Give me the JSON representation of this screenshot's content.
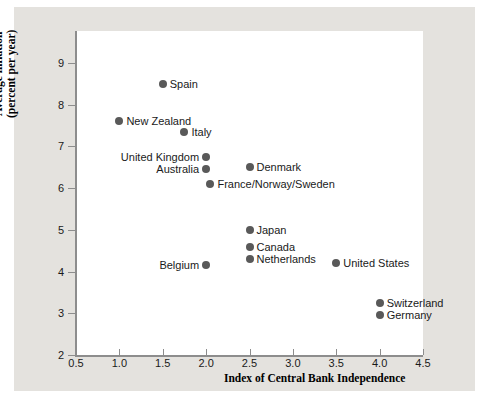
{
  "chart_data": {
    "type": "scatter",
    "title": "",
    "xlabel": "Index of Central Bank Independence",
    "ylabel_line1": "Average inflation",
    "ylabel_line2": "(percent per year)",
    "xlim": [
      0.5,
      4.5
    ],
    "ylim": [
      2,
      9
    ],
    "xticks": [
      "0.5",
      "1.0",
      "1.5",
      "2.0",
      "2.5",
      "3.0",
      "3.5",
      "4.0",
      "4.5"
    ],
    "xtick_values": [
      0.5,
      1.0,
      1.5,
      2.0,
      2.5,
      3.0,
      3.5,
      4.0,
      4.5
    ],
    "yticks": [
      "2",
      "3",
      "4",
      "5",
      "6",
      "7",
      "8",
      "9"
    ],
    "ytick_values": [
      2,
      3,
      4,
      5,
      6,
      7,
      8,
      9
    ],
    "grid": false,
    "legend": "none",
    "marker_color": "#595959",
    "points": [
      {
        "label": "Spain",
        "x": 1.5,
        "y": 8.5,
        "side": "right"
      },
      {
        "label": "New Zealand",
        "x": 1.0,
        "y": 7.6,
        "side": "right"
      },
      {
        "label": "Italy",
        "x": 1.75,
        "y": 7.35,
        "side": "right"
      },
      {
        "label": "United Kingdom",
        "x": 2.0,
        "y": 6.75,
        "side": "left"
      },
      {
        "label": "Australia",
        "x": 2.0,
        "y": 6.45,
        "side": "left"
      },
      {
        "label": "Denmark",
        "x": 2.5,
        "y": 6.5,
        "side": "right"
      },
      {
        "label": "France/Norway/Sweden",
        "x": 2.05,
        "y": 6.1,
        "side": "right"
      },
      {
        "label": "Japan",
        "x": 2.5,
        "y": 5.0,
        "side": "right"
      },
      {
        "label": "Canada",
        "x": 2.5,
        "y": 4.6,
        "side": "right"
      },
      {
        "label": "Netherlands",
        "x": 2.5,
        "y": 4.3,
        "side": "right"
      },
      {
        "label": "Belgium",
        "x": 2.0,
        "y": 4.15,
        "side": "left"
      },
      {
        "label": "United States",
        "x": 3.5,
        "y": 4.2,
        "side": "right"
      },
      {
        "label": "Switzerland",
        "x": 4.0,
        "y": 3.25,
        "side": "right"
      },
      {
        "label": "Germany",
        "x": 4.0,
        "y": 2.95,
        "side": "right"
      }
    ]
  }
}
